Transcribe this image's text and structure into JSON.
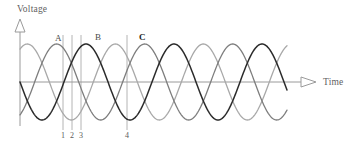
{
  "figure": {
    "width": 359,
    "height": 151,
    "background": "#ffffff"
  },
  "axes": {
    "y_axis": {
      "title": "Voltage",
      "arrow": "triangle-up-hollow",
      "color": "#9a9a9a",
      "x": 20,
      "top": 22,
      "bottom": 126
    },
    "x_axis": {
      "title": "Time",
      "arrow": "triangle-right-hollow",
      "color": "#9a9a9a",
      "y": 82,
      "left": 20,
      "right": 316
    }
  },
  "peak_labels": [
    {
      "text": "A",
      "x": 55,
      "y": 34,
      "emphasis": "normal"
    },
    {
      "text": "B",
      "x": 95,
      "y": 33,
      "emphasis": "normal"
    },
    {
      "text": "C",
      "x": 139,
      "y": 33,
      "emphasis": "bold"
    }
  ],
  "markers": [
    {
      "label": "1",
      "x": 63,
      "top": 35,
      "bottom": 130,
      "label_x": 60,
      "label_y": 132
    },
    {
      "label": "2",
      "x": 72,
      "top": 35,
      "bottom": 130,
      "label_x": 69,
      "label_y": 132
    },
    {
      "label": "3",
      "x": 81,
      "top": 35,
      "bottom": 130,
      "label_x": 78,
      "label_y": 132
    },
    {
      "label": "4",
      "x": 127,
      "top": 35,
      "bottom": 130,
      "label_x": 124,
      "label_y": 132
    }
  ],
  "marker_color": "#b4b4b4",
  "chart_data": {
    "type": "line",
    "title": "",
    "xlabel": "Time",
    "ylabel": "Voltage",
    "grid": false,
    "legend": "none",
    "x_range": [
      20,
      287
    ],
    "y_center": 82,
    "amplitude": 38,
    "period_px": 88,
    "series": [
      {
        "name": "phase-1",
        "color": "#a8a8a8",
        "stroke_width": 1.3,
        "phase_deg": 60,
        "peaks_at_labels": [
          "A"
        ]
      },
      {
        "name": "phase-2",
        "color": "#7d7d7d",
        "stroke_width": 1.3,
        "phase_deg": -60,
        "peaks_at_labels": [
          "B"
        ]
      },
      {
        "name": "phase-3",
        "color": "#2b2b2b",
        "stroke_width": 1.5,
        "phase_deg": 180,
        "peaks_at_labels": [
          "C"
        ]
      }
    ]
  }
}
